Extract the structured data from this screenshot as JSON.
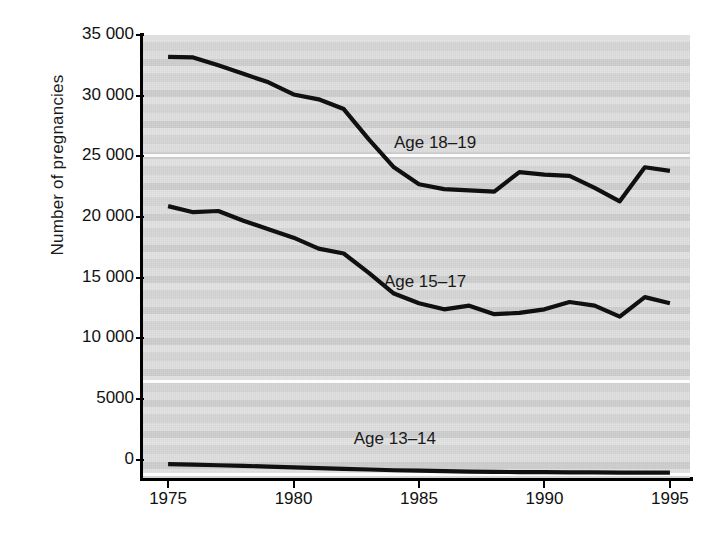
{
  "chart_data": {
    "type": "line",
    "title": "",
    "xlabel": "",
    "ylabel": "Number of pregnancies",
    "xlim": [
      1974,
      1995.8
    ],
    "ylim": [
      -1500,
      35000
    ],
    "xticks": [
      1975,
      1980,
      1985,
      1990,
      1995
    ],
    "xtick_labels": [
      "1975",
      "1980",
      "1985",
      "1990",
      "1995"
    ],
    "yticks": [
      0,
      5000,
      10000,
      15000,
      20000,
      25000,
      30000,
      35000
    ],
    "ytick_labels": [
      "0",
      "5000",
      "10 000",
      "15 000",
      "20 000",
      "25 000",
      "30 000",
      "35 000"
    ],
    "grid": false,
    "legend_position": "inline-annotations",
    "x": [
      1975,
      1976,
      1977,
      1978,
      1979,
      1980,
      1981,
      1982,
      1983,
      1984,
      1985,
      1986,
      1987,
      1988,
      1989,
      1990,
      1991,
      1992,
      1993,
      1994,
      1995
    ],
    "series": [
      {
        "name": "Age 18-19",
        "label": "Age 18–19",
        "values": [
          33200,
          33150,
          32500,
          31800,
          31100,
          30100,
          29700,
          28900,
          26400,
          24100,
          22700,
          22300,
          22200,
          22100,
          23700,
          23500,
          23400,
          22400,
          21300,
          24100,
          23800
        ],
        "label_x": 1984.0,
        "label_y": 26000
      },
      {
        "name": "Age 15-17",
        "label": "Age 15–17",
        "values": [
          20900,
          20400,
          20500,
          19700,
          19000,
          18300,
          17400,
          17000,
          15400,
          13700,
          12900,
          12400,
          12700,
          12000,
          12100,
          12400,
          13000,
          12700,
          11800,
          13400,
          12900
        ],
        "label_x": 1983.6,
        "label_y": 14600
      },
      {
        "name": "Age 13-14",
        "label": "Age 13–14",
        "values": [
          -350,
          -400,
          -450,
          -500,
          -560,
          -620,
          -680,
          -740,
          -800,
          -860,
          -900,
          -940,
          -980,
          -1000,
          -1010,
          -1020,
          -1030,
          -1040,
          -1050,
          -1050,
          -1050
        ],
        "label_x": 1982.4,
        "label_y": 1600
      }
    ]
  },
  "axes": {
    "y_title": "Number of pregnancies"
  }
}
